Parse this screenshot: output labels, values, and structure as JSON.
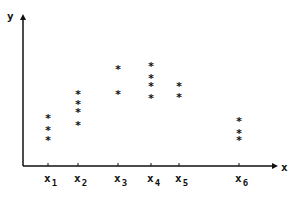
{
  "chart_data": {
    "type": "scatter",
    "title": "",
    "xlabel": "x",
    "ylabel": "y",
    "marker": "*",
    "grid": false,
    "legend": null,
    "categories": [
      "x1",
      "x2",
      "x3",
      "x4",
      "x5",
      "x6"
    ],
    "tick_labels": [
      {
        "base": "x",
        "sub": "1"
      },
      {
        "base": "x",
        "sub": "2"
      },
      {
        "base": "x",
        "sub": "3"
      },
      {
        "base": "x",
        "sub": "4"
      },
      {
        "base": "x",
        "sub": "5"
      },
      {
        "base": "x",
        "sub": "6"
      }
    ],
    "x_positions_relative": [
      1.0,
      2.2,
      3.8,
      5.1,
      6.2,
      8.6
    ],
    "ylim": [
      0,
      10
    ],
    "groups": [
      {
        "x": "x1",
        "y": [
          3.2,
          2.4,
          1.7
        ]
      },
      {
        "x": "x2",
        "y": [
          4.8,
          4.1,
          3.6,
          2.7
        ]
      },
      {
        "x": "x3",
        "y": [
          6.4,
          4.8
        ]
      },
      {
        "x": "x4",
        "y": [
          6.6,
          5.8,
          5.3,
          4.5
        ]
      },
      {
        "x": "x5",
        "y": [
          5.3,
          4.6
        ]
      },
      {
        "x": "x6",
        "y": [
          3.0,
          2.2,
          1.7
        ]
      }
    ],
    "note": "Y axis has no numeric tick labels; y values are estimated in arbitrary units (axis origin = 0, top of axis = 10)."
  },
  "axes": {
    "x_label": "x",
    "y_label": "y"
  },
  "layout": {
    "origin_px": [
      23,
      166
    ],
    "y_top_px": 15,
    "x_end_px": 277,
    "tick_px": [
      48,
      78,
      118,
      151,
      179,
      239
    ],
    "px_per_unit_y": 15.1
  }
}
